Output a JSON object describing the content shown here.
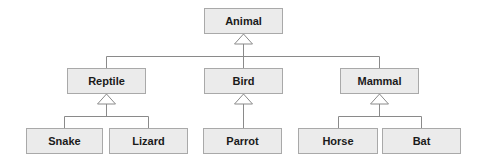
{
  "diagram": {
    "type": "class-hierarchy",
    "colors": {
      "node_fill": "#ebebeb",
      "node_border": "#a9a9a9",
      "line": "#8a8a8a",
      "text": "#1a1a1a"
    },
    "nodes": {
      "animal": {
        "label": "Animal",
        "x": 204,
        "y": 8,
        "w": 79
      },
      "reptile": {
        "label": "Reptile",
        "x": 67,
        "y": 68,
        "w": 79
      },
      "bird": {
        "label": "Bird",
        "x": 204,
        "y": 68,
        "w": 79
      },
      "mammal": {
        "label": "Mammal",
        "x": 340,
        "y": 68,
        "w": 79
      },
      "snake": {
        "label": "Snake",
        "x": 26,
        "y": 128,
        "w": 77
      },
      "lizard": {
        "label": "Lizard",
        "x": 109,
        "y": 128,
        "w": 79
      },
      "parrot": {
        "label": "Parrot",
        "x": 203,
        "y": 128,
        "w": 79
      },
      "horse": {
        "label": "Horse",
        "x": 298,
        "y": 128,
        "w": 80
      },
      "bat": {
        "label": "Bat",
        "x": 382,
        "y": 128,
        "w": 79
      }
    },
    "edges": [
      {
        "parent": "Animal",
        "children": [
          "Reptile",
          "Bird",
          "Mammal"
        ]
      },
      {
        "parent": "Reptile",
        "children": [
          "Snake",
          "Lizard"
        ]
      },
      {
        "parent": "Bird",
        "children": [
          "Parrot"
        ]
      },
      {
        "parent": "Mammal",
        "children": [
          "Horse",
          "Bat"
        ]
      }
    ]
  }
}
